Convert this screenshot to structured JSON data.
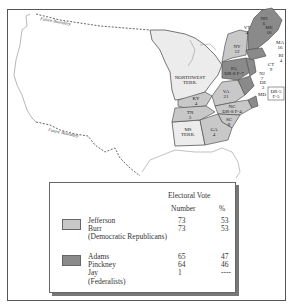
{
  "map": {
    "labels": {
      "future_boundary_north": "Future Boundary",
      "future_boundary_south": "Future Boundary",
      "northwest_terr": [
        "NORTHWEST",
        "TERR."
      ],
      "ms_terr": [
        "MS",
        "TERR."
      ],
      "dr_p_box": [
        "DR-5",
        "F-5"
      ]
    },
    "states": [
      {
        "abbr": "NH",
        "votes": "6",
        "party": "federalist"
      },
      {
        "abbr": "VT",
        "votes": "4",
        "party": "federalist"
      },
      {
        "abbr": "MA",
        "votes": "16",
        "party": "federalist"
      },
      {
        "abbr": "RI",
        "votes": "4",
        "party": "federalist"
      },
      {
        "abbr": "CT",
        "votes": "9",
        "party": "federalist"
      },
      {
        "abbr": "NJ",
        "votes": "7",
        "party": "federalist"
      },
      {
        "abbr": "DE",
        "votes": "3",
        "party": "federalist"
      },
      {
        "abbr": "MD",
        "votes": "",
        "party": "split"
      },
      {
        "abbr": "NY",
        "votes": "12",
        "party": "democratic_republican"
      },
      {
        "abbr": "PA",
        "votes": "DR-8 F-7",
        "party": "split"
      },
      {
        "abbr": "VA",
        "votes": "21",
        "party": "democratic_republican"
      },
      {
        "abbr": "KY",
        "votes": "4",
        "party": "democratic_republican"
      },
      {
        "abbr": "TN",
        "votes": "3",
        "party": "democratic_republican"
      },
      {
        "abbr": "NC",
        "votes": "DR-8 F-4",
        "party": "split"
      },
      {
        "abbr": "SC",
        "votes": "8",
        "party": "democratic_republican"
      },
      {
        "abbr": "GA",
        "votes": "4",
        "party": "democratic_republican"
      },
      {
        "abbr": "ME",
        "votes": "",
        "party": "federalist"
      }
    ],
    "colors": {
      "democratic_republican": "#c8c8c8",
      "federalist": "#8a8a8a",
      "territory": "#ececec",
      "outline": "#555555"
    }
  },
  "legend": {
    "header": "Electoral Vote",
    "col_number": "Number",
    "col_percent": "%",
    "groups": [
      {
        "party": "(Democratic Republicans)",
        "color": "#c8c8c8",
        "candidates": [
          {
            "name": "Jefferson",
            "number": "73",
            "percent": "53"
          },
          {
            "name": "Burr",
            "number": "73",
            "percent": "53"
          }
        ]
      },
      {
        "party": "(Federalists)",
        "color": "#8a8a8a",
        "candidates": [
          {
            "name": "Adams",
            "number": "65",
            "percent": "47"
          },
          {
            "name": "Pinckney",
            "number": "64",
            "percent": "46"
          },
          {
            "name": "Jay",
            "number": "1",
            "percent": "----"
          }
        ]
      }
    ]
  }
}
